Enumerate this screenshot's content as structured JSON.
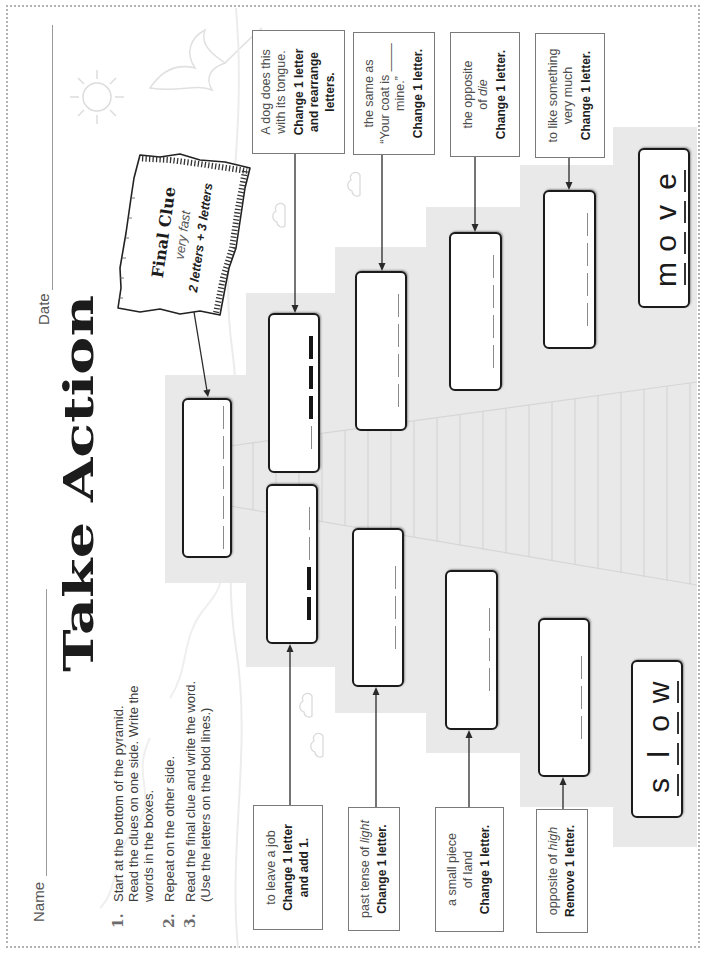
{
  "header": {
    "name_label": "Name",
    "date_label": "Date",
    "title": "Take Action"
  },
  "instructions": [
    {
      "number": "1.",
      "lines": [
        "Start at the bottom of the pyramid.",
        "Read the clues on one side. Write the",
        "words in the boxes."
      ]
    },
    {
      "number": "2.",
      "lines": [
        "Repeat on the other side."
      ]
    },
    {
      "number": "3.",
      "lines": [
        "Read the final clue and write the word.",
        "(Use the letters on the bold lines.)"
      ]
    }
  ],
  "final_clue": {
    "heading": "Final Clue",
    "hint": "very fast",
    "length_hint": "2 letters + 3 letters",
    "blanks": [
      "thin",
      "thin",
      "thin",
      "thin",
      "thin"
    ]
  },
  "start_words": {
    "left": {
      "word": "slow",
      "letters": [
        "s",
        "l",
        "o",
        "w"
      ]
    },
    "right": {
      "word": "move",
      "letters": [
        "m",
        "o",
        "v",
        "e"
      ]
    }
  },
  "left_side": [
    {
      "clue": [
        "to leave a job"
      ],
      "rule": [
        "Change 1 letter",
        "and add 1."
      ],
      "blanks": [
        "bold",
        "bold",
        "thin",
        "thin"
      ]
    },
    {
      "clue_prefix": "past tense of ",
      "clue_italic": "light",
      "rule": [
        "Change 1 letter."
      ],
      "blanks": [
        "thin",
        "thin",
        "thin"
      ]
    },
    {
      "clue": [
        "a small piece",
        "of land"
      ],
      "rule": [
        "Change 1 letter."
      ],
      "blanks": [
        "thin",
        "thin",
        "thin"
      ]
    },
    {
      "clue_prefix": "opposite of ",
      "clue_italic": "high",
      "rule": [
        "Remove 1 letter."
      ],
      "blanks": [
        "thin",
        "thin",
        "thin"
      ]
    }
  ],
  "right_side": [
    {
      "clue": [
        "A dog does this",
        "with its tongue."
      ],
      "rule": [
        "Change 1 letter",
        "and rearrange",
        "letters."
      ],
      "blanks": [
        "thin",
        "bold",
        "bold",
        "bold"
      ]
    },
    {
      "clue": [
        "the same as",
        "“Your coat is ____",
        "mine.”"
      ],
      "rule": [
        "Change 1 letter."
      ],
      "blanks": [
        "thin",
        "thin",
        "thin",
        "thin"
      ]
    },
    {
      "clue": [
        "the opposite"
      ],
      "clue_prefix": "of ",
      "clue_italic": "die",
      "rule": [
        "Change 1 letter."
      ],
      "blanks": [
        "thin",
        "thin",
        "thin",
        "thin"
      ]
    },
    {
      "clue": [
        "to like something",
        "very much"
      ],
      "rule": [
        "Change 1 letter."
      ],
      "blanks": [
        "thin",
        "thin",
        "thin",
        "thin"
      ]
    }
  ],
  "colors": {
    "pyramid": "#e9e9e9",
    "answer_box_border": "#1b1b1b",
    "clue_box_border": "#7a7a7a",
    "page_border": "#b3b3b3"
  }
}
